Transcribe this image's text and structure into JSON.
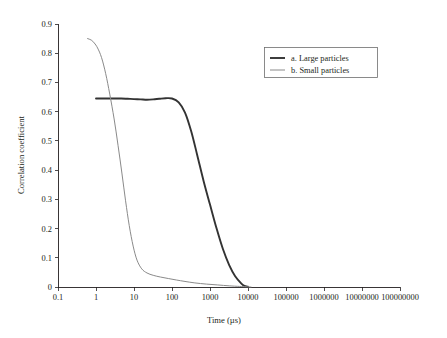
{
  "chart_data": {
    "type": "line",
    "title": "",
    "xlabel": "Time (µs)",
    "ylabel": "Correlation coefficient",
    "xscale": "log",
    "yscale": "linear",
    "xlim": [
      0.1,
      100000000
    ],
    "ylim": [
      0,
      0.9
    ],
    "grid": false,
    "legend_position": "top-right",
    "xticks": [
      "0.1",
      "1",
      "10",
      "100",
      "1000",
      "10000",
      "100000",
      "1000000",
      "10000000",
      "100000000"
    ],
    "xtick_values": [
      0.1,
      1,
      10,
      100,
      1000,
      10000,
      100000,
      1000000,
      10000000,
      100000000
    ],
    "yticks": [
      "0",
      "0.1",
      "0.2",
      "0.3",
      "0.4",
      "0.5",
      "0.6",
      "0.7",
      "0.8",
      "0.9"
    ],
    "ytick_values": [
      0,
      0.1,
      0.2,
      0.3,
      0.4,
      0.5,
      0.6,
      0.7,
      0.8,
      0.9
    ],
    "series": [
      {
        "name": "a. Large particles",
        "color": "#333333",
        "width": 1.9,
        "x": [
          1,
          1.5,
          2.2,
          3.2,
          4.6,
          6.8,
          10,
          15,
          22,
          32,
          46,
          68,
          100,
          150,
          220,
          320,
          460,
          680,
          1000,
          1500,
          2200,
          3200,
          4600,
          6800,
          8000,
          10000
        ],
        "y": [
          0.645,
          0.645,
          0.645,
          0.645,
          0.645,
          0.644,
          0.643,
          0.642,
          0.641,
          0.642,
          0.644,
          0.646,
          0.645,
          0.632,
          0.597,
          0.533,
          0.452,
          0.362,
          0.282,
          0.199,
          0.129,
          0.075,
          0.037,
          0.011,
          0.004,
          0.001
        ]
      },
      {
        "name": "b. Small particles",
        "color": "#8a8a8a",
        "width": 1.0,
        "x": [
          0.6,
          0.75,
          0.9,
          1.1,
          1.4,
          1.8,
          2.3,
          3.0,
          3.8,
          4.8,
          6.0,
          7.5,
          9.5,
          12,
          16,
          22,
          32,
          50,
          80,
          130,
          220,
          400,
          800,
          1600,
          3200,
          6000,
          9000,
          12000
        ],
        "y": [
          0.85,
          0.845,
          0.835,
          0.818,
          0.785,
          0.73,
          0.66,
          0.575,
          0.485,
          0.39,
          0.295,
          0.21,
          0.14,
          0.092,
          0.062,
          0.048,
          0.04,
          0.034,
          0.029,
          0.024,
          0.019,
          0.014,
          0.01,
          0.007,
          0.004,
          0.002,
          0.001,
          0.0
        ]
      }
    ]
  },
  "legend": {
    "entries": [
      {
        "label": "a. Large particles"
      },
      {
        "label": "b. Small particles"
      }
    ]
  }
}
